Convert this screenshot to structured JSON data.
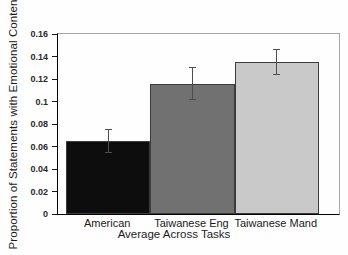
{
  "chart_data": {
    "type": "bar",
    "title": "",
    "categories": [
      "American",
      "Taiwanese Eng",
      "Taiwanese Mand"
    ],
    "values": [
      0.065,
      0.116,
      0.135
    ],
    "errors": [
      0.01,
      0.014,
      0.011
    ],
    "bar_colors": [
      "#0d0d0d",
      "#717171",
      "#c9c9c9"
    ],
    "bar_border_color": "#3c3c3c",
    "error_bar_color": "#4d4d4d",
    "xlabel": "Average Across Tasks",
    "ylabel": "Proportion of Statements with Emotional Content",
    "ylim": [
      0,
      0.16
    ],
    "ytick_labels": [
      "0.16",
      "0.14",
      "0.12",
      "0.1",
      "0.08",
      "0.06",
      "0.04",
      "0.02",
      "0"
    ],
    "grid": false,
    "legend": "none"
  }
}
